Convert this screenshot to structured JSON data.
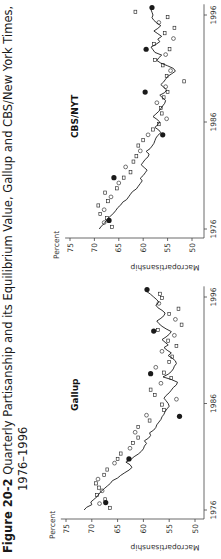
{
  "figure": {
    "number": "Figure 20-2",
    "title_line1": "Quarterly Partisanship and its Equilibrium Value, Gallup and CBS/New York Times,",
    "title_line2": "1976–1996"
  },
  "chart_data": [
    {
      "type": "line",
      "title": "Gallup",
      "xlabel": "",
      "ylabel": "Macropartisanship",
      "y_unit_label": "Percent",
      "xlim": [
        1975.0,
        1997.0
      ],
      "ylim": [
        50,
        75
      ],
      "x_ticks": [
        1976,
        1986,
        1996
      ],
      "y_ticks": [
        50,
        55,
        60,
        65,
        70,
        75
      ],
      "grid": false,
      "series": [
        {
          "name": "Equilibrium value (line)",
          "style": "line",
          "x": [
            1976.0,
            1976.25,
            1976.5,
            1976.75,
            1977.0,
            1977.25,
            1977.5,
            1977.75,
            1978.0,
            1978.25,
            1978.5,
            1978.75,
            1979.0,
            1979.25,
            1979.5,
            1979.75,
            1980.0,
            1980.25,
            1980.5,
            1980.75,
            1981.0,
            1981.25,
            1981.5,
            1981.75,
            1982.0,
            1982.25,
            1982.5,
            1982.75,
            1983.0,
            1983.25,
            1983.5,
            1983.75,
            1984.0,
            1984.25,
            1984.5,
            1984.75,
            1985.0,
            1985.25,
            1985.5,
            1985.75,
            1986.0,
            1986.25,
            1986.5,
            1986.75,
            1987.0,
            1987.25,
            1987.5,
            1987.75,
            1988.0,
            1988.25,
            1988.5,
            1988.75,
            1989.0,
            1989.25,
            1989.5,
            1989.75,
            1990.0,
            1990.25,
            1990.5,
            1990.75,
            1991.0,
            1991.25,
            1991.5,
            1991.75,
            1992.0,
            1992.25,
            1992.5,
            1992.75,
            1993.0,
            1993.25,
            1993.5,
            1993.75,
            1994.0,
            1994.25,
            1994.5,
            1994.75,
            1995.0,
            1995.25,
            1995.5,
            1995.75,
            1996.0,
            1996.25,
            1996.5
          ],
          "values": [
            71.5,
            71.0,
            70.0,
            70.2,
            69.6,
            69.0,
            68.6,
            68.2,
            67.6,
            67.0,
            66.4,
            66.0,
            65.0,
            64.4,
            63.6,
            62.8,
            62.2,
            62.6,
            63.4,
            62.4,
            61.8,
            61.0,
            60.4,
            60.0,
            59.8,
            59.4,
            59.8,
            59.0,
            58.6,
            58.8,
            58.0,
            57.6,
            57.4,
            57.0,
            56.6,
            56.4,
            56.0,
            55.8,
            55.4,
            55.0,
            55.2,
            55.6,
            56.0,
            55.6,
            55.0,
            54.6,
            54.2,
            53.6,
            53.4,
            54.6,
            56.2,
            55.2,
            54.6,
            54.2,
            54.0,
            53.6,
            53.8,
            54.4,
            55.2,
            54.6,
            55.4,
            56.0,
            55.2,
            55.8,
            56.4,
            55.6,
            55.0,
            54.6,
            55.6,
            56.4,
            57.0,
            57.4,
            56.6,
            56.0,
            55.8,
            56.4,
            57.2,
            57.6,
            57.0,
            57.4,
            58.0,
            58.6,
            59.3
          ]
        },
        {
          "name": "Quarterly partisanship (open squares/circles)",
          "style": "markers",
          "x": [
            1976.2,
            1976.6,
            1977.0,
            1977.4,
            1977.8,
            1978.1,
            1978.5,
            1978.9,
            1979.3,
            1979.8,
            1980.4,
            1980.8,
            1981.3,
            1981.8,
            1982.3,
            1982.8,
            1983.3,
            1983.8,
            1984.4,
            1984.9,
            1985.4,
            1985.9,
            1986.4,
            1986.8,
            1987.3,
            1987.9,
            1988.4,
            1988.9,
            1989.4,
            1989.9,
            1990.4,
            1990.9,
            1991.4,
            1991.9,
            1992.4,
            1992.9,
            1993.4,
            1993.9,
            1994.4,
            1994.9,
            1995.4,
            1995.9,
            1996.3
          ],
          "values": [
            66.5,
            68.5,
            67.4,
            69.0,
            68.0,
            68.6,
            69.2,
            68.8,
            67.6,
            67.0,
            65.6,
            65.0,
            64.4,
            62.6,
            62.0,
            61.0,
            61.6,
            61.0,
            58.8,
            59.4,
            56.0,
            56.4,
            53.6,
            57.8,
            58.6,
            56.6,
            54.6,
            56.0,
            57.6,
            55.0,
            54.4,
            56.4,
            53.6,
            55.2,
            54.0,
            57.2,
            52.6,
            53.8,
            55.0,
            53.2,
            57.0,
            56.4,
            56.8
          ]
        },
        {
          "name": "Election-period highlight (filled circles)",
          "style": "filled-markers",
          "x": [
            1976.7,
            1980.8,
            1984.8,
            1988.8,
            1992.8,
            1996.7
          ],
          "values": [
            67.3,
            62.8,
            53.0,
            58.6,
            58.0,
            59.3
          ]
        }
      ]
    },
    {
      "type": "line",
      "title": "CBS/NYT",
      "xlabel": "",
      "ylabel": "Macropartisanship",
      "y_unit_label": "Percent",
      "xlim": [
        1975.0,
        1997.0
      ],
      "ylim": [
        50,
        75
      ],
      "x_ticks": [
        1976,
        1986,
        1996
      ],
      "y_ticks": [
        50,
        55,
        60,
        65,
        70,
        75
      ],
      "grid": false,
      "series": [
        {
          "name": "Equilibrium value (line)",
          "style": "line",
          "x": [
            1976.0,
            1976.25,
            1976.5,
            1976.75,
            1977.0,
            1977.25,
            1977.5,
            1977.75,
            1978.0,
            1978.25,
            1978.5,
            1978.75,
            1979.0,
            1979.25,
            1979.5,
            1979.75,
            1980.0,
            1980.25,
            1980.5,
            1980.75,
            1981.0,
            1981.25,
            1981.5,
            1981.75,
            1982.0,
            1982.25,
            1982.5,
            1982.75,
            1983.0,
            1983.25,
            1983.5,
            1983.75,
            1984.0,
            1984.25,
            1984.5,
            1984.75,
            1985.0,
            1985.25,
            1985.5,
            1985.75,
            1986.0,
            1986.25,
            1986.5,
            1986.75,
            1987.0,
            1987.25,
            1987.5,
            1987.75,
            1988.0,
            1988.25,
            1988.5,
            1988.75,
            1989.0,
            1989.25,
            1989.5,
            1989.75,
            1990.0,
            1990.25,
            1990.5,
            1990.75,
            1991.0,
            1991.25,
            1991.5,
            1991.75,
            1992.0,
            1992.25,
            1992.5,
            1992.75,
            1993.0,
            1993.25,
            1993.5,
            1993.75,
            1994.0,
            1994.25,
            1994.5,
            1994.75,
            1995.0,
            1995.25,
            1995.5,
            1995.75,
            1996.0,
            1996.25,
            1996.5
          ],
          "values": [
            69.0,
            68.6,
            68.0,
            67.6,
            67.2,
            66.6,
            66.0,
            65.6,
            65.2,
            64.6,
            64.2,
            63.4,
            63.0,
            62.6,
            62.2,
            61.4,
            61.0,
            60.6,
            60.2,
            60.6,
            60.0,
            59.6,
            59.2,
            59.8,
            60.4,
            60.0,
            59.6,
            59.0,
            58.8,
            59.4,
            58.6,
            58.2,
            57.8,
            57.6,
            57.4,
            57.0,
            56.4,
            56.8,
            57.6,
            57.0,
            56.6,
            57.2,
            58.0,
            57.4,
            56.8,
            56.4,
            56.0,
            55.6,
            55.4,
            56.0,
            56.6,
            55.6,
            55.2,
            55.8,
            56.4,
            55.8,
            55.4,
            55.0,
            54.2,
            53.4,
            53.8,
            55.0,
            56.4,
            57.2,
            56.8,
            56.2,
            57.6,
            58.0,
            58.4,
            57.4,
            56.6,
            57.0,
            56.2,
            57.0,
            57.8,
            57.0,
            56.4,
            57.2,
            57.8,
            58.2,
            58.0,
            58.2,
            58.4
          ]
        },
        {
          "name": "Quarterly partisanship (open squares/circles)",
          "style": "markers",
          "x": [
            1976.2,
            1976.6,
            1977.0,
            1977.4,
            1977.8,
            1978.2,
            1978.6,
            1979.0,
            1979.4,
            1979.8,
            1980.3,
            1980.8,
            1981.3,
            1981.8,
            1982.3,
            1982.8,
            1983.3,
            1983.8,
            1984.3,
            1984.8,
            1985.3,
            1985.8,
            1986.3,
            1986.8,
            1987.3,
            1987.8,
            1988.3,
            1988.8,
            1989.3,
            1989.8,
            1990.3,
            1990.8,
            1991.3,
            1991.8,
            1992.3,
            1992.8,
            1993.3,
            1993.8,
            1994.3,
            1994.8,
            1995.3,
            1995.8,
            1996.3
          ],
          "values": [
            66.4,
            68.0,
            67.4,
            68.8,
            68.0,
            69.2,
            67.2,
            66.6,
            67.8,
            65.4,
            65.0,
            64.0,
            62.6,
            63.6,
            62.0,
            61.4,
            60.6,
            61.0,
            60.0,
            59.0,
            58.0,
            56.8,
            55.2,
            56.2,
            56.4,
            57.2,
            55.8,
            55.0,
            55.4,
            51.6,
            55.2,
            54.4,
            56.0,
            57.6,
            55.4,
            54.6,
            57.8,
            53.8,
            55.6,
            53.6,
            56.8,
            55.0,
            61.6
          ]
        },
        {
          "name": "Election-period highlight (filled circles)",
          "style": "filled-markers",
          "x": [
            1976.8,
            1980.8,
            1984.8,
            1988.8,
            1992.8,
            1996.7
          ],
          "values": [
            67.0,
            66.0,
            56.0,
            59.6,
            59.4,
            58.2
          ]
        }
      ]
    }
  ],
  "panels": [
    {
      "title": "Gallup",
      "y_unit_label": "Percent",
      "y_axis_label": "Macropartisanship",
      "y_tick_labels": [
        "75",
        "70",
        "65",
        "60",
        "55",
        "50"
      ],
      "x_tick_labels": [
        "1976",
        "1986",
        "1996"
      ]
    },
    {
      "title": "CBS/NYT",
      "y_unit_label": "Percent",
      "y_axis_label": "Macropartisanship",
      "y_tick_labels": [
        "75",
        "70",
        "65",
        "60",
        "55",
        "50"
      ],
      "x_tick_labels": [
        "1976",
        "1986",
        "1996"
      ]
    }
  ],
  "colors": {
    "ink": "#1a1a1a",
    "axis": "#444444",
    "background": "#ffffff"
  }
}
